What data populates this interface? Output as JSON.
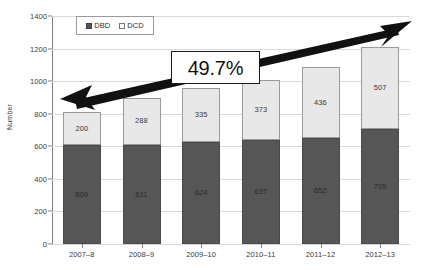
{
  "chart_data": {
    "type": "bar",
    "stacked": true,
    "title": "",
    "subtitle": "",
    "xlabel": "",
    "ylabel": "Number",
    "ylim": [
      0,
      1400
    ],
    "ytick_step": 200,
    "yticks": [
      0,
      200,
      400,
      600,
      800,
      1000,
      1200,
      1400
    ],
    "ytick_labels": [
      "0",
      "200",
      "400",
      "600",
      "800",
      "1000",
      "1200",
      "1400"
    ],
    "grid": true,
    "grid_axis": "y",
    "legend_position": "top-left-inside",
    "categories": [
      "2007–8",
      "2008–9",
      "2009–10",
      "2010–11",
      "2011–12",
      "2012–13"
    ],
    "series": [
      {
        "name": "DBD",
        "color": "#565656",
        "values": [
          609,
          611,
          624,
          637,
          652,
          705
        ]
      },
      {
        "name": "DCD",
        "color": "#e8e8e8",
        "values": [
          200,
          288,
          335,
          373,
          436,
          507
        ]
      }
    ],
    "totals": [
      809,
      899,
      959,
      1010,
      1088,
      1212
    ],
    "annotations": [
      {
        "type": "callout",
        "text": "49.7%",
        "arrow": "double-headed",
        "from": "2007–8",
        "to": "2012–13"
      }
    ]
  },
  "legend": {
    "items": [
      {
        "label": "DBD",
        "swatch": "dark-square-icon"
      },
      {
        "label": "DCD",
        "swatch": "light-square-icon"
      }
    ]
  },
  "axes": {
    "y_title": "Number",
    "y_ticks": [
      "1400",
      "1200",
      "1000",
      "800",
      "600",
      "400",
      "200",
      "0"
    ],
    "x_ticks": [
      "2007–8",
      "2008–9",
      "2009–10",
      "2010–11",
      "2011–12",
      "2012–13"
    ]
  },
  "callout": {
    "value": "49.7%"
  },
  "colors": {
    "dbd": "#565656",
    "dcd": "#e8e8e8",
    "grid": "#d9d9d9",
    "axis": "#808080",
    "annotation": "#111111"
  }
}
